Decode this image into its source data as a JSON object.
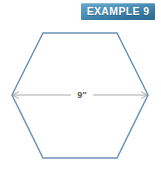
{
  "figure": {
    "background_color": "#ffffff",
    "width": 161,
    "height": 179
  },
  "badge": {
    "text": "EXAMPLE 9",
    "example_number": "9",
    "text_color": "#ffffff",
    "gradient_top_color": "#6aa6ca",
    "gradient_bottom_color": "#2c6a92"
  },
  "shape": {
    "name": "hexagon",
    "sides": 6,
    "stroke_color": "#6b93b8",
    "fill": "none",
    "stroke_width": "1.5",
    "orientation": "flat-top",
    "points": "12,95 43,33 117,33 148,95 117,158 43,158"
  },
  "dimension": {
    "label": "9″",
    "value": "9",
    "unit": "″",
    "measures": "width across corners",
    "line_color": "#a9a9a9",
    "label_color": "#59595b",
    "arrow_start_x": "13",
    "arrow_end_x": "147",
    "line_y": "95"
  }
}
